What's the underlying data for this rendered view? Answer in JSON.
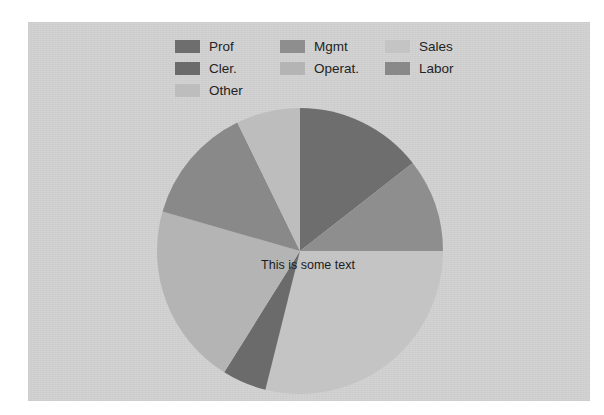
{
  "panel": {
    "background_color": "#d2d2d2"
  },
  "legend": {
    "position": "top",
    "columns": 3,
    "items": [
      {
        "label": "Prof",
        "color": "#6e6e6e"
      },
      {
        "label": "Mgmt",
        "color": "#8e8e8e"
      },
      {
        "label": "Sales",
        "color": "#c4c4c4"
      },
      {
        "label": "Cler.",
        "color": "#6b6b6b"
      },
      {
        "label": "Operat.",
        "color": "#b4b4b4"
      },
      {
        "label": "Labor",
        "color": "#898989"
      },
      {
        "label": "Other",
        "color": "#bdbdbd"
      }
    ]
  },
  "annotation": {
    "center_text": "This is some text"
  },
  "chart_data": {
    "type": "pie",
    "title": "",
    "xlabel": "",
    "ylabel": "",
    "grid": false,
    "legend_position": "top",
    "start_angle_deg": 0,
    "direction": "clockwise",
    "categories": [
      "Prof",
      "Mgmt",
      "Sales",
      "Cler.",
      "Operat.",
      "Labor",
      "Other"
    ],
    "values": [
      14.5,
      10.5,
      29.0,
      5.0,
      20.5,
      13.5,
      7.0
    ],
    "units": "percent",
    "angles_deg": [
      52,
      38,
      104,
      18,
      74,
      48,
      26
    ],
    "colors": [
      "#6e6e6e",
      "#8e8e8e",
      "#c4c4c4",
      "#6b6b6b",
      "#b4b4b4",
      "#898989",
      "#bdbdbd"
    ],
    "annotations": [
      "This is some text"
    ]
  }
}
